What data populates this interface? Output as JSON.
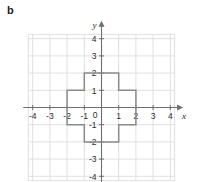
{
  "panel": {
    "label": "b"
  },
  "chart_data": {
    "type": "line",
    "title": "",
    "subtitle": "",
    "xlabel": "x",
    "ylabel": "y",
    "xlim": [
      -4.5,
      4.5
    ],
    "ylim": [
      -4.5,
      4.5
    ],
    "grid": true,
    "grid_step": 1,
    "legend": null,
    "legend_position": "none",
    "x_tick_labels": [
      "-4",
      "-3",
      "-2",
      "-1",
      "0",
      "1",
      "2",
      "3",
      "4"
    ],
    "x_ticks": [
      -4,
      -3,
      -2,
      -1,
      0,
      1,
      2,
      3,
      4
    ],
    "y_tick_labels": [
      "4",
      "3",
      "2",
      "1",
      "0",
      "-1",
      "-2",
      "-3",
      "-4"
    ],
    "y_ticks": [
      4,
      3,
      2,
      1,
      0,
      -1,
      -2,
      -3,
      -4
    ],
    "origin_label": "0",
    "axis_arrows": [
      "x-positive",
      "y-positive"
    ],
    "series": [
      {
        "name": "cross-polygon",
        "closed": true,
        "stroke_color": "#8c8c8c",
        "fill": "none",
        "points": [
          [
            -1,
            2
          ],
          [
            1,
            2
          ],
          [
            1,
            1
          ],
          [
            2,
            1
          ],
          [
            2,
            -1
          ],
          [
            1,
            -1
          ],
          [
            1,
            -2
          ],
          [
            -1,
            -2
          ],
          [
            -1,
            -1
          ],
          [
            -2,
            -1
          ],
          [
            -2,
            1
          ],
          [
            -1,
            1
          ]
        ]
      }
    ],
    "annotations": [
      {
        "text": "b",
        "role": "panel-letter",
        "position": "top-left"
      }
    ],
    "colors": {
      "gridline": "#dcdcdc",
      "axis": "#6e6e6e",
      "shape_stroke": "#8c8c8c",
      "text": "#2b2b2b",
      "background": "#ffffff"
    }
  }
}
